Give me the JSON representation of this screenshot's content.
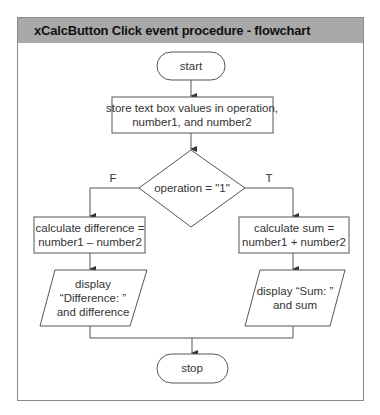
{
  "header": {
    "title": "xCalcButton Click event procedure - flowchart"
  },
  "colors": {
    "header_bg": "#a9a9a9",
    "line": "#555555",
    "border": "#8a8a8a"
  },
  "flowchart": {
    "start": "start",
    "process_input": {
      "line1": "store text box values in operation,",
      "line2": "number1, and number2"
    },
    "decision": "operation = \"1\"",
    "false_label": "F",
    "true_label": "T",
    "false_process": {
      "line1": "calculate difference =",
      "line2": "number1 – number2"
    },
    "true_process": {
      "line1": "calculate sum =",
      "line2": "number1 + number2"
    },
    "false_output": {
      "line1": "display",
      "line2": "“Difference: ”",
      "line3": "and difference"
    },
    "true_output": {
      "line1": "display “Sum: ”",
      "line2": "and sum"
    },
    "stop": "stop"
  }
}
